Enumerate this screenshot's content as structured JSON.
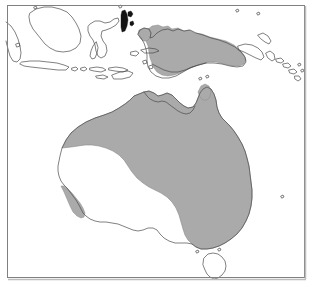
{
  "figure": {
    "type": "distribution-range-map",
    "title": "",
    "caption": "",
    "region_name": "Australasia",
    "projection_extent": {
      "west_label": "",
      "east_label": "",
      "north_label": "",
      "south_label": ""
    }
  },
  "colors": {
    "background": "#ffffff",
    "ocean": "#ffffff",
    "land_fill": "#ffffff",
    "land_outline": "#4a4a4a",
    "range_fill": "#aaaaaa",
    "range_outline": "#8a8a8a",
    "dark_island_fill": "#141414",
    "frame_stroke": "#808080",
    "frame_shadow": "#bdbdbd"
  },
  "frame": {
    "x": 6,
    "y": 4,
    "width": 299,
    "height": 274,
    "stroke_width": 1
  },
  "legend": {
    "present": false,
    "entries": [
      {
        "swatch_color": "#aaaaaa",
        "label": ""
      }
    ]
  },
  "landmasses": [
    {
      "name": "australia",
      "label": "Australia",
      "shaded": "partial"
    },
    {
      "name": "new-guinea",
      "label": "New Guinea",
      "shaded": "partial"
    },
    {
      "name": "tasmania",
      "label": "Tasmania",
      "shaded": "none"
    },
    {
      "name": "borneo",
      "label": "Borneo",
      "shaded": "none"
    },
    {
      "name": "sulawesi",
      "label": "Sulawesi",
      "shaded": "none"
    },
    {
      "name": "java",
      "label": "Java",
      "shaded": "none"
    },
    {
      "name": "sumatra",
      "label": "Sumatra",
      "shaded": "none"
    },
    {
      "name": "lesser-sundas",
      "label": "Lesser Sunda Islands",
      "shaded": "none"
    },
    {
      "name": "halmahera",
      "label": "Halmahera",
      "shaded": "dark"
    },
    {
      "name": "new-britain",
      "label": "New Britain",
      "shaded": "none"
    },
    {
      "name": "solomon-islands",
      "label": "Solomon Islands",
      "shaded": "none"
    },
    {
      "name": "vanuatu",
      "label": "Vanuatu",
      "shaded": "none"
    }
  ],
  "chart_data": {
    "type": "map",
    "title": "",
    "range_regions": [
      {
        "region": "New Guinea (central and northern)",
        "shaded": true
      },
      {
        "region": "New Guinea (southern coastal lowlands)",
        "shaded": false
      },
      {
        "region": "Northern Western Australia (Kimberley / Pilbara coast)",
        "shaded": true
      },
      {
        "region": "Northern Territory / Arnhem Land",
        "shaded": true
      },
      {
        "region": "Gulf of Carpentaria coast",
        "shaded": true
      },
      {
        "region": "Cape York Peninsula",
        "shaded": true
      },
      {
        "region": "Queensland east coast",
        "shaded": true
      },
      {
        "region": "New South Wales east",
        "shaded": true
      },
      {
        "region": "Victoria",
        "shaded": true
      },
      {
        "region": "Central arid interior",
        "shaded": false
      },
      {
        "region": "South Australia / Nullarbor",
        "shaded": false
      },
      {
        "region": "Southwest Western Australia (small isolated patch)",
        "shaded": true
      },
      {
        "region": "Tasmania",
        "shaded": false
      }
    ]
  }
}
